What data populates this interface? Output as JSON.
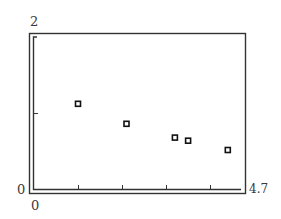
{
  "chart_data": {
    "type": "scatter",
    "title": "",
    "xlabel": "",
    "ylabel": "",
    "xlim": [
      0,
      4.7
    ],
    "ylim": [
      0,
      2
    ],
    "x_tick_labels": {
      "min": "0",
      "max": "4.7"
    },
    "y_tick_labels": {
      "min": "0",
      "max": "2"
    },
    "x_ticks": [
      1,
      2,
      3,
      4
    ],
    "y_ticks": [
      1
    ],
    "grid": false,
    "legend": null,
    "marker": "hollow-square",
    "series": [
      {
        "name": "data",
        "points": [
          {
            "x": 1.0,
            "y": 1.12
          },
          {
            "x": 2.1,
            "y": 0.86
          },
          {
            "x": 3.2,
            "y": 0.68
          },
          {
            "x": 3.5,
            "y": 0.64
          },
          {
            "x": 4.4,
            "y": 0.52
          }
        ]
      }
    ]
  },
  "labels": {
    "y_max": "2",
    "y_min": "0",
    "x_min": "0",
    "x_max": "4.7"
  }
}
